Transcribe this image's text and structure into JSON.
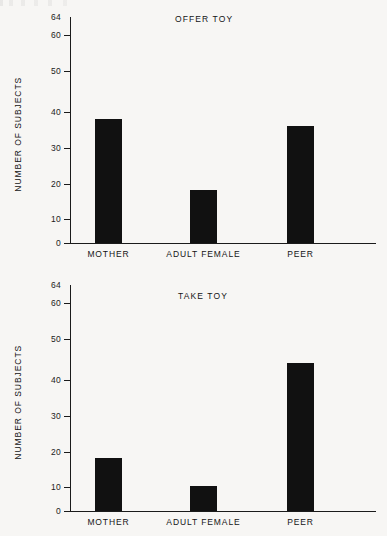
{
  "figure": {
    "y_axis_title": "NUMBER OF SUBJECTS",
    "axis_max_label": "64",
    "tick_labels": [
      "60",
      "50",
      "40",
      "30",
      "20",
      "10",
      "0"
    ],
    "categories": [
      "MOTHER",
      "ADULT FEMALE",
      "PEER"
    ],
    "bar_color": "#111111",
    "axis_color": "#1b1b1b",
    "background": "#f7f6f4"
  },
  "chart_data": [
    {
      "type": "bar",
      "title": "OFFER TOY",
      "categories": [
        "MOTHER",
        "ADULT FEMALE",
        "PEER"
      ],
      "values": [
        35,
        15,
        33
      ],
      "xlabel": "",
      "ylabel": "NUMBER OF SUBJECTS",
      "ylim": [
        0,
        64
      ],
      "yticks": [
        0,
        10,
        20,
        30,
        40,
        50,
        60
      ],
      "ytick_labels": [
        "0",
        "10",
        "20",
        "30",
        "40",
        "50",
        "60"
      ],
      "axis_top_label": "64",
      "grid": false,
      "legend": "none"
    },
    {
      "type": "bar",
      "title": "TAKE TOY",
      "categories": [
        "MOTHER",
        "ADULT FEMALE",
        "PEER"
      ],
      "values": [
        15,
        7,
        42
      ],
      "xlabel": "",
      "ylabel": "NUMBER OF SUBJECTS",
      "ylim": [
        0,
        64
      ],
      "yticks": [
        0,
        10,
        20,
        30,
        40,
        50,
        60
      ],
      "ytick_labels": [
        "0",
        "10",
        "20",
        "30",
        "40",
        "50",
        "60"
      ],
      "axis_top_label": "64",
      "grid": false,
      "legend": "none"
    }
  ]
}
